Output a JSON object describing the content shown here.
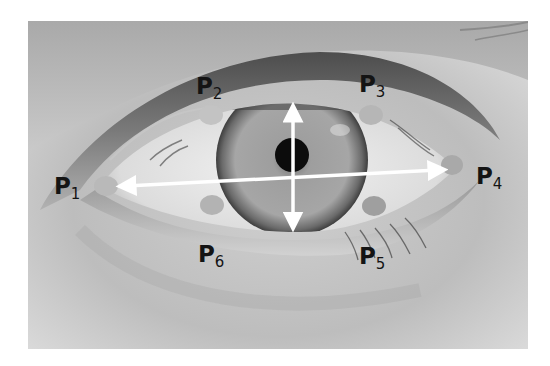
{
  "figure": {
    "palette": {
      "background": "#ffffff",
      "skin_light": "#d6d6d6",
      "skin_mid": "#a8a8a8",
      "eyelid_dark": "#585858",
      "sclera": "#e8e8e8",
      "iris": "#9a9a9a",
      "pupil": "#0c0c0c",
      "landmark": "#b9b9b9",
      "arrow": "#ffffff",
      "label": "#141414"
    }
  },
  "landmarks": [
    {
      "id": "p1",
      "prefix": "P",
      "sub": "1",
      "role": "outer corner"
    },
    {
      "id": "p2",
      "prefix": "P",
      "sub": "2",
      "role": "upper lid left"
    },
    {
      "id": "p3",
      "prefix": "P",
      "sub": "3",
      "role": "upper lid right"
    },
    {
      "id": "p4",
      "prefix": "P",
      "sub": "4",
      "role": "inner corner"
    },
    {
      "id": "p5",
      "prefix": "P",
      "sub": "5",
      "role": "lower lid right"
    },
    {
      "id": "p6",
      "prefix": "P",
      "sub": "6",
      "role": "lower lid left"
    }
  ],
  "arrows": [
    {
      "id": "horizontal",
      "meaning": "eye width P1-P4",
      "double_headed": true
    },
    {
      "id": "vertical",
      "meaning": "eye opening height",
      "double_headed": true
    }
  ]
}
